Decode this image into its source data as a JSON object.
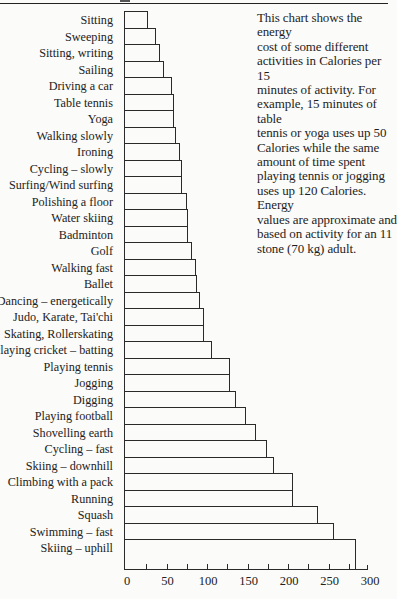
{
  "description": {
    "lines": [
      "This chart shows the energy",
      "cost of some different",
      "activities in Calories per 15",
      "minutes of activity. For",
      "example, 15 minutes of table",
      "tennis or yoga uses up 50",
      "Calories while the same",
      "amount of time spent",
      "playing tennis or jogging",
      "uses up 120 Calories. Energy",
      "values are approximate and",
      "based on activity for an 11",
      "stone (70 kg) adult."
    ]
  },
  "chart_data": {
    "type": "bar",
    "orientation": "horizontal",
    "title": "",
    "xlabel": "Calories per 15 minutes",
    "ylabel": "",
    "xlim": [
      0,
      300
    ],
    "xticks": [
      0,
      50,
      100,
      150,
      200,
      250,
      300
    ],
    "minor_tick_step": 25,
    "grid": false,
    "legend": null,
    "annotation": "This chart shows the energy cost of some different activities in Calories per 15 minutes of activity. For example, 15 minutes of table tennis or yoga uses up 50 Calories while the same amount of time spent playing tennis or jogging uses up 120 Calories. Energy values are approximate and based on activity for an 11 stone (70 kg) adult.",
    "categories": [
      "Sitting",
      "Sweeping",
      "Sitting, writing",
      "Sailing",
      "Driving a car",
      "Table tennis",
      "Yoga",
      "Walking slowly",
      "Ironing",
      "Cycling – slowly",
      "Surfing/Wind surfing",
      "Polishing a floor",
      "Water skiing",
      "Badminton",
      "Golf",
      "Walking fast",
      "Ballet",
      "Dancing – energetically",
      "Judo, Karate, Tai'chi",
      "Skating, Rollerskating",
      "Playing cricket – batting",
      "Playing tennis",
      "Jogging",
      "Digging",
      "Playing football",
      "Shovelling earth",
      "Cycling – fast",
      "Skiing – downhill",
      "Climbing with a pack",
      "Running",
      "Squash",
      "Swimming – fast",
      "Skiing – uphill"
    ],
    "values": [
      17,
      28,
      33,
      38,
      47,
      50,
      50,
      52,
      57,
      60,
      60,
      66,
      68,
      68,
      73,
      78,
      79,
      82,
      88,
      88,
      98,
      120,
      120,
      128,
      140,
      153,
      166,
      175,
      199,
      199,
      230,
      250,
      278
    ]
  }
}
